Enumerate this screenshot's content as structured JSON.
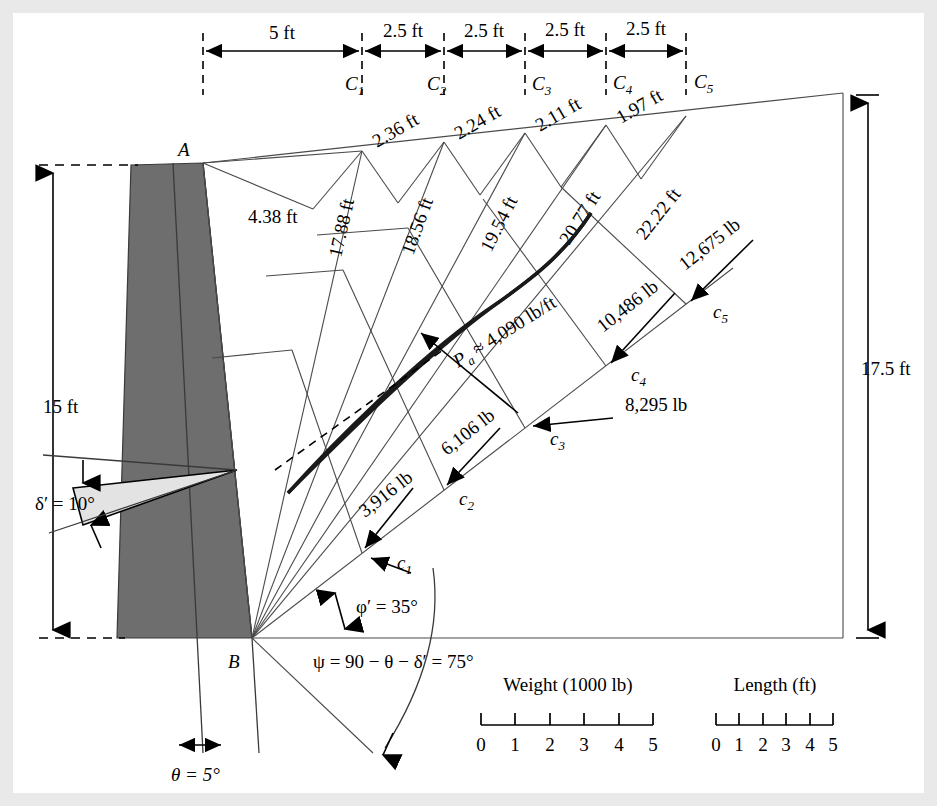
{
  "figure": {
    "type": "culmann-graphical-construction",
    "title_points": {
      "A": "A",
      "B": "B"
    },
    "top_dimensions": {
      "segments": [
        "5 ft",
        "2.5 ft",
        "2.5 ft",
        "2.5 ft",
        "2.5 ft"
      ]
    },
    "surface_points": [
      {
        "id": "C1",
        "label": "C",
        "sub": "1"
      },
      {
        "id": "C2",
        "label": "C",
        "sub": "2"
      },
      {
        "id": "C3",
        "label": "C",
        "sub": "3"
      },
      {
        "id": "C4",
        "label": "C",
        "sub": "4"
      },
      {
        "id": "C5",
        "label": "C",
        "sub": "5"
      }
    ],
    "force_points": [
      {
        "id": "c1",
        "label": "c",
        "sub": "1"
      },
      {
        "id": "c2",
        "label": "c",
        "sub": "2"
      },
      {
        "id": "c3",
        "label": "c",
        "sub": "3"
      },
      {
        "id": "c4",
        "label": "c",
        "sub": "4"
      },
      {
        "id": "c5",
        "label": "c",
        "sub": "5"
      }
    ],
    "slice_widths": [
      "2.36 ft",
      "2.24 ft",
      "2.11 ft",
      "1.97 ft"
    ],
    "radial_lengths": [
      "17.88 ft",
      "18.56 ft",
      "19.54 ft",
      "20.77 ft",
      "22.22 ft"
    ],
    "top_slope_length": "4.38 ft",
    "cumulative_weights": [
      "3,916 lb",
      "6,106 lb",
      "8,295 lb",
      "10,486 lb",
      "12,675 lb"
    ],
    "resultant": "P_a ≈ 4,090 lb/ft",
    "resultant_parts": {
      "symbol": "P",
      "sub": "a",
      "value": "≈ 4,090 lb/ft"
    },
    "height_left": "15 ft",
    "height_right": "17.5 ft",
    "angles": {
      "delta": "δ′ = 10°",
      "phi": "φ′ = 35°",
      "psi": "ψ = 90 − θ − δ′ = 75°",
      "theta": "θ = 5°"
    },
    "scales": [
      {
        "name": "weight-scale",
        "title": "Weight (1000 lb)",
        "ticks": [
          "0",
          "1",
          "2",
          "3",
          "4",
          "5"
        ]
      },
      {
        "name": "length-scale",
        "title": "Length (ft)",
        "ticks": [
          "0",
          "1",
          "2",
          "3",
          "4",
          "5"
        ]
      }
    ],
    "colors": {
      "wall_fill": "#6e6e6e",
      "wedge_fill": "#e3e3e3",
      "line": "#4a4a4a",
      "page_bg": "#e9e9e9"
    }
  }
}
